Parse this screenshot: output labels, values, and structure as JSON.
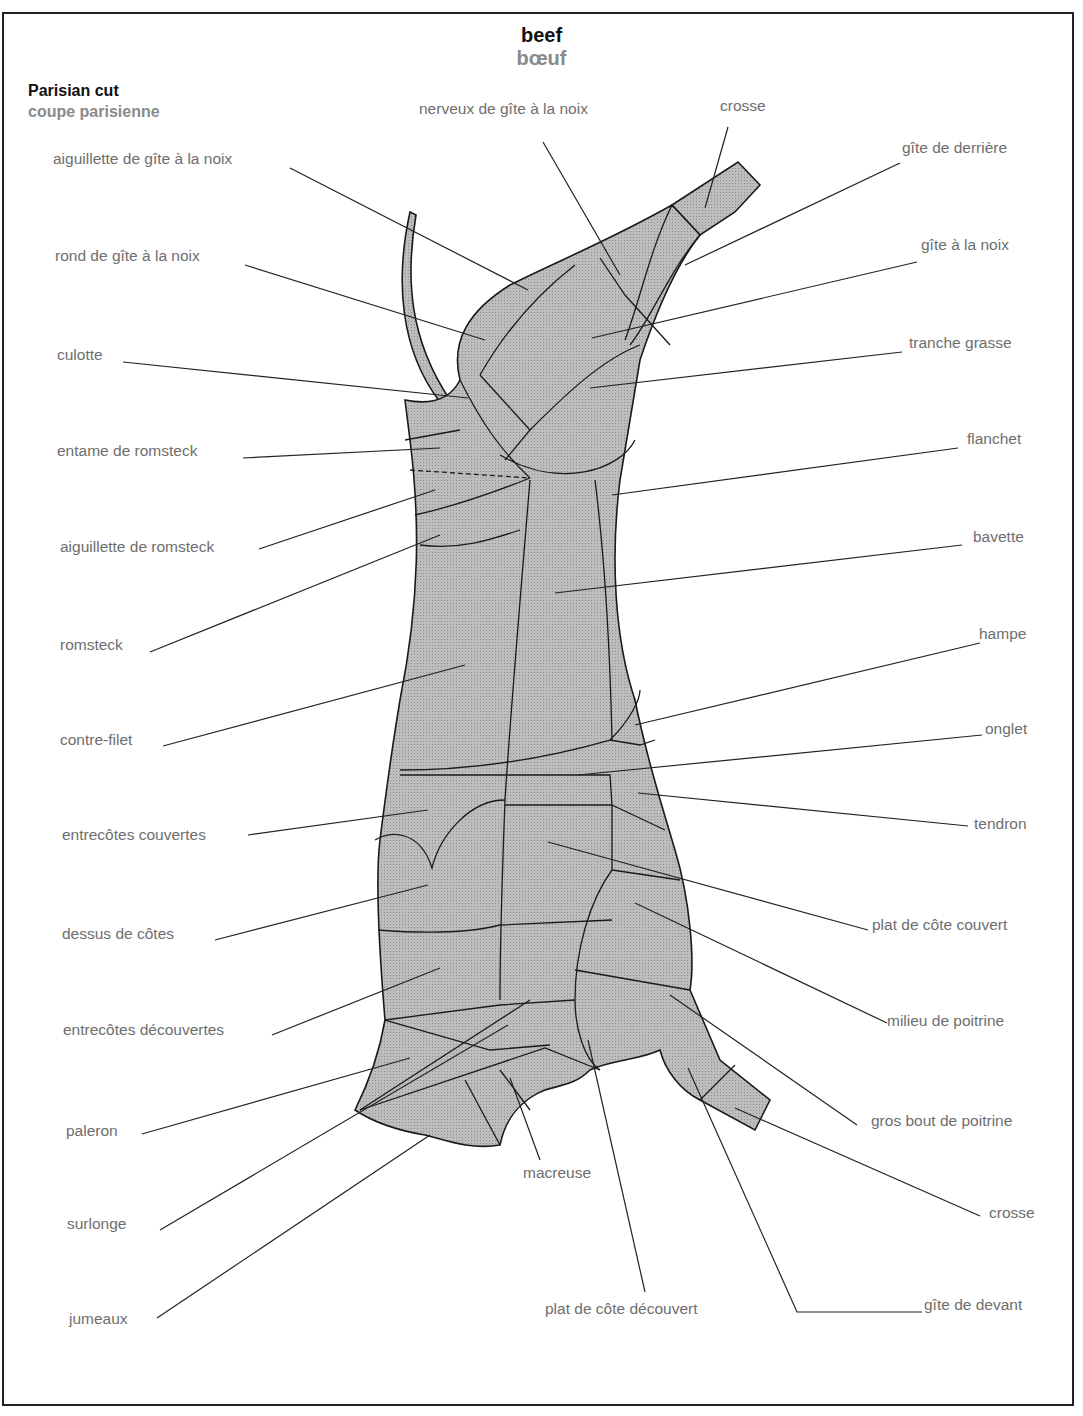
{
  "header": {
    "title_en": "beef",
    "title_fr": "bœuf",
    "subtitle_en": "Parisian cut",
    "subtitle_fr": "coupe parisienne"
  },
  "colors": {
    "carcass_fill": "#b4b4b4",
    "outline": "#1a1a1a",
    "label_text": "#6e6e6e",
    "leader_line": "#222222"
  },
  "labels": {
    "left": [
      "aiguillette de gîte à la noix",
      "rond de gîte à la noix",
      "culotte",
      "entame de romsteck",
      "aiguillette de romsteck",
      "romsteck",
      "contre-filet",
      "entrecôtes couvertes",
      "dessus de côtes",
      "entrecôtes découvertes",
      "paleron",
      "surlonge",
      "jumeaux"
    ],
    "top": [
      "nerveux de gîte à la noix",
      "crosse"
    ],
    "right": [
      "gîte de derrière",
      "gîte à la noix",
      "tranche grasse",
      "flanchet",
      "bavette",
      "hampe",
      "onglet",
      "tendron",
      "plat de côte couvert",
      "milieu de poitrine",
      "gros bout de poitrine",
      "crosse",
      "gîte de devant"
    ],
    "bottom": [
      "macreuse",
      "plat de côte découvert"
    ]
  }
}
